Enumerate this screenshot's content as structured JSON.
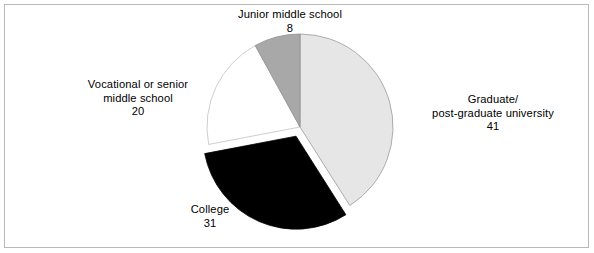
{
  "chart_data": {
    "type": "pie",
    "title": "",
    "subtitle": "",
    "xlabel": "",
    "ylabel": "",
    "legend_position": "none",
    "grid": false,
    "total": 100,
    "start_angle_deg": 0,
    "direction": "clockwise",
    "categories": [
      "Graduate/post-graduate university",
      "College",
      "Vocational or senior middle school",
      "Junior middle school"
    ],
    "values": [
      41,
      31,
      20,
      8
    ],
    "slices": [
      {
        "id": "graduate",
        "label_lines": [
          "Graduate/",
          "post-graduate university"
        ],
        "value": 41,
        "value_text": "41",
        "color": "#e6e6e6",
        "stroke": "#9a9a9a",
        "exploded": false,
        "start_deg": 0,
        "end_deg": 147.6
      },
      {
        "id": "college",
        "label_lines": [
          "College"
        ],
        "value": 31,
        "value_text": "31",
        "color": "#000000",
        "stroke": "#000000",
        "exploded": true,
        "start_deg": 147.6,
        "end_deg": 259.2
      },
      {
        "id": "vocational",
        "label_lines": [
          "Vocational or senior",
          "middle school"
        ],
        "value": 20,
        "value_text": "20",
        "color": "#ffffff",
        "stroke": "#c2c2c2",
        "exploded": false,
        "start_deg": 259.2,
        "end_deg": 331.2
      },
      {
        "id": "junior",
        "label_lines": [
          "Junior middle school"
        ],
        "value": 8,
        "value_text": "8",
        "color": "#a8a8a8",
        "stroke": "#8f8f8f",
        "exploded": false,
        "start_deg": 331.2,
        "end_deg": 360
      }
    ]
  },
  "labels": {
    "graduate": {
      "line1": "Graduate/",
      "line2": "post-graduate university",
      "value": "41"
    },
    "junior": {
      "line1": "Junior middle school",
      "value": "8"
    },
    "vocational": {
      "line1": "Vocational or senior",
      "line2": "middle school",
      "value": "20"
    },
    "college": {
      "line1": "College",
      "value": "31"
    }
  },
  "colors": {
    "graduate_slice": "#e6e6e6",
    "college_slice": "#000000",
    "vocational_slice": "#ffffff",
    "junior_slice": "#a8a8a8",
    "frame_border": "#b9b9b9",
    "page_background": "#ffffff",
    "text": "#000000"
  }
}
